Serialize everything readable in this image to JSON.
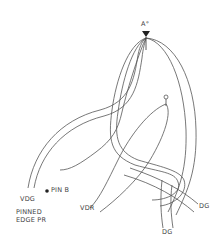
{
  "diagram": {
    "type": "knot-tying diagram",
    "labels": {
      "top_arrow": "A°",
      "pin_b": "PIN B",
      "vdg": "VDG",
      "pinned_edge_line1": "PINNED",
      "pinned_edge_line2": "EDGE PR",
      "vdr": "VDR",
      "dg_right": "DG",
      "dg_bottom": "DG"
    },
    "markers": [
      {
        "name": "top-arrow",
        "shape": "downward-triangle",
        "x": 146,
        "y": 32
      },
      {
        "name": "pin-b-dot",
        "shape": "filled-circle",
        "x": 47,
        "y": 191
      },
      {
        "name": "tack-pin",
        "shape": "pin",
        "x": 166,
        "y": 97
      }
    ],
    "colors": {
      "line": "#555555",
      "text": "#444444",
      "background": "#ffffff"
    }
  }
}
